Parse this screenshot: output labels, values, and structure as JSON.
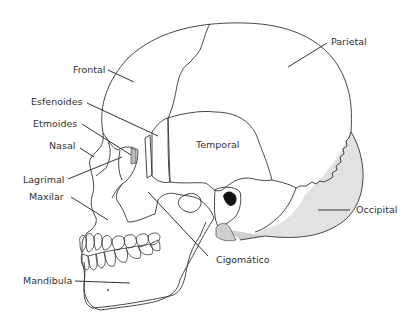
{
  "diagram": {
    "colors": {
      "background": "#ffffff",
      "outline": "#333333",
      "occipital_fill": "#e2e2e2",
      "shade_dark": "#c8c8c8",
      "label_text": "#333333"
    },
    "labels": {
      "frontal": "Frontal",
      "parietal": "Parietal",
      "esfenoides": "Esfenoides",
      "etmoides": "Etmoides",
      "temporal": "Temporal",
      "nasal": "Nasal",
      "lagrimal": "Lagrimal",
      "maxilar": "Maxilar",
      "occipital": "Occipital",
      "cigomatico": "Cigomático",
      "mandibula": "Mandibula"
    }
  }
}
